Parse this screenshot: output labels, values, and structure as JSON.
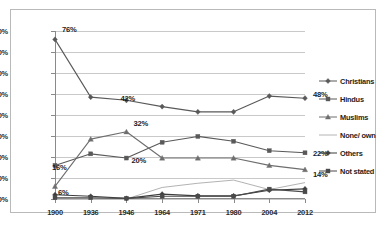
{
  "chart_data": {
    "type": "line",
    "title": "",
    "xlabel": "",
    "ylabel": "",
    "categories": [
      "1900",
      "1936",
      "1946",
      "1964",
      "1971",
      "1980",
      "2004",
      "2012"
    ],
    "ylim": [
      0,
      80
    ],
    "ytick_labels": [
      "0%",
      "10%",
      "20%",
      "30%",
      "40%",
      "50%",
      "60%",
      "70%",
      "80%"
    ],
    "ytick_values": [
      0,
      10,
      20,
      30,
      40,
      50,
      60,
      70,
      80
    ],
    "grid": "horizontal",
    "legend_position": "right",
    "series": [
      {
        "name": "Christians",
        "marker": "diamond",
        "color": "#595959",
        "values": [
          76,
          48.5,
          47,
          44,
          41.5,
          41.5,
          49,
          48
        ]
      },
      {
        "name": "Hindus",
        "marker": "square",
        "color": "#595959",
        "values": [
          16,
          21.5,
          19.5,
          27,
          29.8,
          27.5,
          23,
          22
        ]
      },
      {
        "name": "Muslims",
        "marker": "triangle",
        "color": "#6e6e6e",
        "values": [
          6,
          28.5,
          32,
          19.5,
          19.5,
          19.5,
          16,
          14
        ]
      },
      {
        "name": "None/ own",
        "marker": "none",
        "color": "#b3b3b3",
        "values": [
          0,
          0,
          0,
          5.5,
          7.5,
          9,
          4.5,
          7.8
        ]
      },
      {
        "name": "Others",
        "marker": "diamond",
        "color": "#3d3d3d",
        "values": [
          2,
          1.3,
          0.3,
          2.3,
          1.5,
          1.5,
          4.2,
          4.8
        ]
      },
      {
        "name": "Not stated",
        "marker": "square",
        "color": "#4a4a4a",
        "values": [
          0.6,
          0.6,
          0.3,
          1.3,
          1.3,
          1.3,
          4.7,
          3.4
        ]
      }
    ],
    "data_labels": [
      {
        "text": "76%",
        "series": "Christians",
        "category": "1900",
        "value": 76
      },
      {
        "text": "42%",
        "series": "Christians",
        "category": "1946",
        "value": 47
      },
      {
        "text": "48%",
        "series": "Christians",
        "category": "2012",
        "value": 48
      },
      {
        "text": "32%",
        "series": "Muslims",
        "category": "1946",
        "value": 32
      },
      {
        "text": "20%",
        "series": "Hindus",
        "category": "1946",
        "value": 19.5
      },
      {
        "text": "16%",
        "series": "Hindus",
        "category": "1900",
        "value": 16
      },
      {
        "text": "6%",
        "series": "Muslims",
        "category": "1900",
        "value": 6
      },
      {
        "text": "22%",
        "series": "Hindus",
        "category": "2012",
        "value": 22
      },
      {
        "text": "14%",
        "series": "Muslims",
        "category": "2012",
        "value": 14
      }
    ]
  },
  "legend": {
    "items": [
      {
        "label": "Christians"
      },
      {
        "label": "Hindus"
      },
      {
        "label": "Muslims"
      },
      {
        "label": "None/ own"
      },
      {
        "label": "Others"
      },
      {
        "label": "Not stated"
      }
    ]
  },
  "axes": {
    "y_labels": [
      "80%",
      "70%",
      "60%",
      "50%",
      "40%",
      "30%",
      "20%",
      "10%",
      "0%"
    ],
    "x_labels": [
      "1900",
      "1936",
      "1946",
      "1964",
      "1971",
      "1980",
      "2004",
      "2012"
    ]
  },
  "labels": {
    "l76": "76%",
    "l42": "42%",
    "l48": "48%",
    "l32": "32%",
    "l20": "20%",
    "l16": "16%",
    "l6": "6%",
    "l22": "22%",
    "l14": "14%"
  },
  "colors": {
    "christians": "#595959",
    "hindus": "#595959",
    "muslims": "#6e6e6e",
    "none_own": "#b3b3b3",
    "others": "#3d3d3d",
    "not_stated": "#4a4a4a",
    "grid": "#c9c9c9",
    "axis": "#8a8a8a",
    "frame": "#b9b9b9",
    "background": "#ffffff"
  }
}
